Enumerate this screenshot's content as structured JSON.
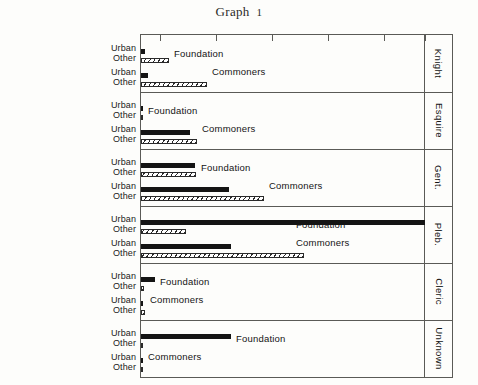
{
  "title": {
    "text": "Graph",
    "number": "1"
  },
  "axis": {
    "tick_count": 6,
    "tick_positions_px": [
      160,
      216,
      272,
      328,
      384,
      425
    ],
    "labels_shown": false,
    "baseline_px": 140,
    "scale_max_px": 285
  },
  "row_labels": {
    "urban": "Urban",
    "other": "Other"
  },
  "group_labels": {
    "foundation": "Foundation",
    "commoners": "Commoners"
  },
  "chart_data": {
    "type": "bar",
    "orientation": "horizontal",
    "xlabel": "",
    "ylabel": "",
    "grid": false,
    "legend_position": "none",
    "note": "Six stacked panels by social rank; each panel shows Foundation and Commoners, each split into Urban (solid black) and Other (diagonal hatched). Values are bar lengths in pixels from the axis baseline.",
    "series": [
      {
        "name": "Urban",
        "style": "solid-black"
      },
      {
        "name": "Other",
        "style": "diagonal-hatch"
      }
    ],
    "panels": [
      {
        "category": "Knight",
        "bars": [
          {
            "group": "Foundation",
            "series": "Urban",
            "length": 4
          },
          {
            "group": "Foundation",
            "series": "Other",
            "length": 28
          },
          {
            "group": "Commoners",
            "series": "Urban",
            "length": 7
          },
          {
            "group": "Commoners",
            "series": "Other",
            "length": 66
          }
        ]
      },
      {
        "category": "Esquire",
        "bars": [
          {
            "group": "Foundation",
            "series": "Urban",
            "length": 2
          },
          {
            "group": "Foundation",
            "series": "Other",
            "length": 2
          },
          {
            "group": "Commoners",
            "series": "Urban",
            "length": 49
          },
          {
            "group": "Commoners",
            "series": "Other",
            "length": 56
          }
        ]
      },
      {
        "category": "Gent.",
        "bars": [
          {
            "group": "Foundation",
            "series": "Urban",
            "length": 54
          },
          {
            "group": "Foundation",
            "series": "Other",
            "length": 55
          },
          {
            "group": "Commoners",
            "series": "Urban",
            "length": 88
          },
          {
            "group": "Commoners",
            "series": "Other",
            "length": 123
          }
        ]
      },
      {
        "category": "Pleb.",
        "bars": [
          {
            "group": "Foundation",
            "series": "Urban",
            "length": 284
          },
          {
            "group": "Foundation",
            "series": "Other",
            "length": 45
          },
          {
            "group": "Commoners",
            "series": "Urban",
            "length": 90
          },
          {
            "group": "Commoners",
            "series": "Other",
            "length": 163
          }
        ]
      },
      {
        "category": "Cleric",
        "bars": [
          {
            "group": "Foundation",
            "series": "Urban",
            "length": 14
          },
          {
            "group": "Foundation",
            "series": "Other",
            "length": 3
          },
          {
            "group": "Commoners",
            "series": "Urban",
            "length": 2
          },
          {
            "group": "Commoners",
            "series": "Other",
            "length": 4
          }
        ]
      },
      {
        "category": "Unknown",
        "bars": [
          {
            "group": "Foundation",
            "series": "Urban",
            "length": 90
          },
          {
            "group": "Foundation",
            "series": "Other",
            "length": 2
          },
          {
            "group": "Commoners",
            "series": "Urban",
            "length": 2
          },
          {
            "group": "Commoners",
            "series": "Other",
            "length": 2
          }
        ]
      }
    ]
  }
}
